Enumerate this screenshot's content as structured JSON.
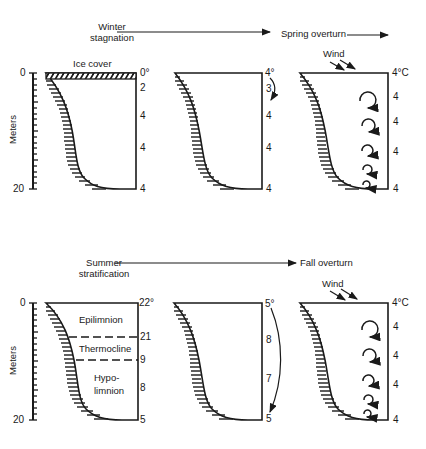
{
  "rows": [
    {
      "stage_left": {
        "line1": "Winter",
        "line2": "stagnation"
      },
      "stage_right": "Spring overturn",
      "axis": {
        "label": "Meters",
        "top": "0",
        "bottom": "20"
      },
      "panels": [
        {
          "annotation": "Ice cover",
          "temps": [
            "0°",
            "2",
            "4",
            "4",
            "4"
          ]
        },
        {
          "temps": [
            "4°",
            "3",
            "4",
            "4",
            "4"
          ]
        },
        {
          "annotation": "Wind",
          "temps": [
            "4°C",
            "4",
            "4",
            "4",
            "4"
          ]
        }
      ]
    },
    {
      "stage_left": {
        "line1": "Summer",
        "line2": "stratification"
      },
      "stage_right": "Fall overturn",
      "axis": {
        "label": "Meters",
        "top": "0",
        "bottom": "20"
      },
      "panels": [
        {
          "zones": [
            "Epilimnion",
            "Thermocline",
            "Hypo-",
            "limnion"
          ],
          "temps": [
            "22°",
            "21",
            "9",
            "8",
            "5"
          ]
        },
        {
          "temps": [
            "5°",
            "8",
            "7",
            "5"
          ]
        },
        {
          "annotation": "Wind",
          "temps": [
            "4°C",
            "4",
            "4",
            "4",
            "4"
          ]
        }
      ]
    }
  ]
}
